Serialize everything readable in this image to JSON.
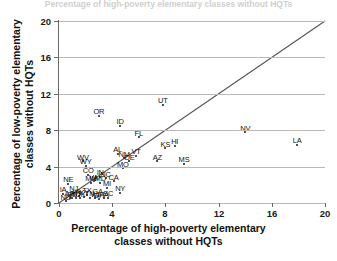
{
  "top_caption": "Percentage of high-poverty elementary classes without HQTs",
  "axes": {
    "xlabel_line1": "Percentage of high-poverty elementary",
    "xlabel_line2": "classes without HQTs",
    "ylabel_line1": "Percentage of low-poverty elementary",
    "ylabel_line2": "classes without HQTs",
    "xticks": [
      "0",
      "4",
      "8",
      "12",
      "16",
      "20"
    ],
    "yticks": [
      "0",
      "4",
      "8",
      "12",
      "16",
      "20"
    ]
  },
  "colors": {
    "grid": "#b9b9b9",
    "axis": "#6a6a6a",
    "point": "#111111",
    "identity_line": "#555555",
    "background": "#ffffff"
  },
  "chart_data": {
    "type": "scatter",
    "title": "",
    "xlabel": "Percentage of high-poverty elementary classes without HQTs",
    "ylabel": "Percentage of low-poverty elementary classes without HQTs",
    "xlim": [
      0,
      20
    ],
    "ylim": [
      0,
      20
    ],
    "xticks": [
      0,
      4,
      8,
      12,
      16,
      20
    ],
    "yticks": [
      0,
      4,
      8,
      12,
      16,
      20
    ],
    "grid": "horizontal",
    "legend": "none",
    "reference_line": {
      "type": "identity",
      "label": "y = x",
      "from": [
        0,
        0
      ],
      "to": [
        20,
        20
      ]
    },
    "point_label_field": "state",
    "points": [
      {
        "state": "LA",
        "x": 17.9,
        "y": 6.4
      },
      {
        "state": "NV",
        "x": 14.0,
        "y": 7.8
      },
      {
        "state": "MS",
        "x": 9.4,
        "y": 4.3
      },
      {
        "state": "HI",
        "x": 8.7,
        "y": 6.3
      },
      {
        "state": "KS",
        "x": 8.0,
        "y": 6.0
      },
      {
        "state": "AZ",
        "x": 7.4,
        "y": 4.6
      },
      {
        "state": "UT",
        "x": 7.8,
        "y": 10.8
      },
      {
        "state": "FL",
        "x": 6.0,
        "y": 7.2
      },
      {
        "state": "VT",
        "x": 5.8,
        "y": 5.2
      },
      {
        "state": "DE",
        "x": 5.3,
        "y": 4.6
      },
      {
        "state": "NM",
        "x": 4.9,
        "y": 4.9
      },
      {
        "state": "MO",
        "x": 4.8,
        "y": 3.8
      },
      {
        "state": "AL",
        "x": 4.4,
        "y": 5.4
      },
      {
        "state": "ID",
        "x": 4.6,
        "y": 8.5
      },
      {
        "state": "OR",
        "x": 3.0,
        "y": 9.6
      },
      {
        "state": "NY",
        "x": 4.6,
        "y": 1.1
      },
      {
        "state": "CA",
        "x": 4.1,
        "y": 2.4
      },
      {
        "state": "MI",
        "x": 3.6,
        "y": 1.7
      },
      {
        "state": "NC",
        "x": 3.5,
        "y": 2.7
      },
      {
        "state": "MD",
        "x": 3.1,
        "y": 2.2
      },
      {
        "state": "IN",
        "x": 3.1,
        "y": 2.9
      },
      {
        "state": "VA",
        "x": 2.6,
        "y": 2.4
      },
      {
        "state": "MN",
        "x": 2.4,
        "y": 2.2
      },
      {
        "state": "CO",
        "x": 2.2,
        "y": 3.1
      },
      {
        "state": "WY",
        "x": 2.0,
        "y": 4.1
      },
      {
        "state": "WV",
        "x": 1.8,
        "y": 4.6
      },
      {
        "state": "NE",
        "x": 0.7,
        "y": 2.1
      },
      {
        "state": "IA",
        "x": 0.3,
        "y": 1.0
      },
      {
        "state": "ND",
        "x": 0.5,
        "y": 0.2
      },
      {
        "state": "SD",
        "x": 1.0,
        "y": 0.5
      },
      {
        "state": "MT",
        "x": 1.3,
        "y": 0.6
      },
      {
        "state": "OK",
        "x": 1.6,
        "y": 0.5
      },
      {
        "state": "KY",
        "x": 1.9,
        "y": 0.7
      },
      {
        "state": "TN",
        "x": 2.3,
        "y": 0.6
      },
      {
        "state": "WI",
        "x": 2.7,
        "y": 0.5
      },
      {
        "state": "OH",
        "x": 3.0,
        "y": 0.4
      },
      {
        "state": "PA",
        "x": 3.4,
        "y": 0.5
      },
      {
        "state": "SC",
        "x": 3.7,
        "y": 0.6
      },
      {
        "state": "GA",
        "x": 2.9,
        "y": 0.8
      },
      {
        "state": "TX",
        "x": 2.1,
        "y": 0.9
      },
      {
        "state": "IL",
        "x": 1.5,
        "y": 0.8
      },
      {
        "state": "NJ",
        "x": 1.1,
        "y": 1.1
      },
      {
        "state": "AR",
        "x": 0.8,
        "y": 0.6
      }
    ]
  }
}
